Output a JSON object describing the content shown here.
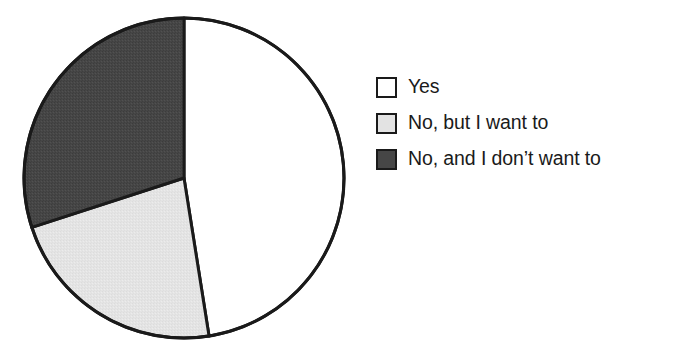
{
  "chart_data": {
    "type": "pie",
    "title": "",
    "xlabel": "",
    "ylabel": "",
    "categories": [
      "Yes",
      "No, but I want to",
      "No, and I don’t want to"
    ],
    "values": [
      47.5,
      22.5,
      30
    ],
    "unit": "%",
    "start_angle_deg": 0,
    "direction": "clockwise",
    "slice_angles_deg": [
      171,
      81,
      108
    ],
    "slice_boundaries_deg": [
      0,
      171,
      252,
      360
    ],
    "colors": [
      "#ffffff",
      "#e3e3e3",
      "#464646"
    ],
    "edge_color": "#1a1a1a",
    "grid": false,
    "legend_position": "right",
    "series": [
      {
        "name": "Yes",
        "value": 47.5,
        "color": "#ffffff"
      },
      {
        "name": "No, but I want to",
        "value": 22.5,
        "color": "#e3e3e3"
      },
      {
        "name": "No, and I don’t want to",
        "value": 30,
        "color": "#464646"
      }
    ]
  },
  "figure": {
    "title_clipped": "",
    "pie": {
      "center_x": 184,
      "center_y": 178,
      "radius": 160,
      "stroke_width": 3
    }
  },
  "legend": {
    "items": [
      {
        "label": "Yes",
        "swatch_name": "legend-swatch-yes",
        "color": "#ffffff"
      },
      {
        "label": "No, but I want to",
        "swatch_name": "legend-swatch-no-but-want",
        "color": "#e3e3e3"
      },
      {
        "label": "No, and I don’t want to",
        "swatch_name": "legend-swatch-no-and-dont-want",
        "color": "#464646"
      }
    ]
  }
}
